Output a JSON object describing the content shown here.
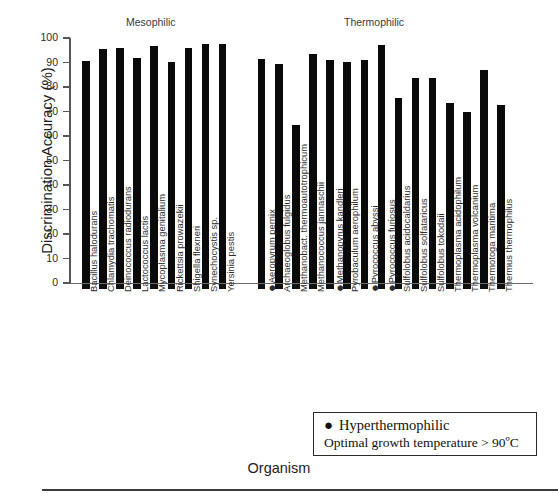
{
  "chart_data": {
    "type": "bar",
    "title": "",
    "xlabel": "Organism",
    "ylabel": "Discrimination Accuracy (%)",
    "ylim": [
      0,
      100
    ],
    "ytick_labels": [
      "0",
      "10",
      "20",
      "30",
      "40",
      "50",
      "60",
      "70",
      "80",
      "90",
      "100"
    ],
    "yticks": [
      0,
      10,
      20,
      30,
      40,
      50,
      60,
      70,
      80,
      90,
      100
    ],
    "grid": false,
    "legend_position": "bottom-right",
    "group_headers": [
      {
        "label": "Mesophilic",
        "start_index": 0,
        "end_index": 8
      },
      {
        "label": "Thermophilic",
        "start_index": 9,
        "end_index": 23
      }
    ],
    "categories": [
      "Bacillus halodurans",
      "Chlamydia trachomatis",
      "Deinococcus radiodurans",
      "Lactococcus lactis",
      "Mycoplasma genitalium",
      "Rickettsia prowazekii",
      "Shigella flexneri",
      "Synechocystis sp.",
      "Yersinia pestis",
      "Aeropyrum pernix",
      "Archaeoglobus fulgidus",
      "Methanobact. thermoautotrophicum",
      "Methanococcus jannaschii",
      "Methanopyrus kandleri",
      "Pyrobaculum aerophilum",
      "Pyrococcus abyssi",
      "Pyrococcus furiosus",
      "Sulfolobus acidocaldarius",
      "Sulfolobus solfataricus",
      "Sulfolobus tokodaii",
      "Thermoplasma acidophilum",
      "Thermoplasma volcanium",
      "Thermotoga maritima",
      "Thermus thermophilus"
    ],
    "values": [
      90.7,
      95.6,
      96.0,
      91.7,
      96.8,
      90.1,
      96.1,
      97.7,
      97.6,
      91.5,
      89.3,
      64.5,
      93.3,
      91.0,
      90.3,
      91.0,
      97.0,
      75.5,
      83.5,
      83.5,
      73.5,
      70.0,
      86.8,
      72.7
    ],
    "hyperthermophilic_flags": [
      false,
      false,
      false,
      false,
      false,
      false,
      false,
      false,
      false,
      true,
      false,
      false,
      false,
      true,
      false,
      true,
      true,
      false,
      false,
      false,
      false,
      false,
      false,
      false
    ],
    "group_of": [
      "Mesophilic",
      "Mesophilic",
      "Mesophilic",
      "Mesophilic",
      "Mesophilic",
      "Mesophilic",
      "Mesophilic",
      "Mesophilic",
      "Mesophilic",
      "Thermophilic",
      "Thermophilic",
      "Thermophilic",
      "Thermophilic",
      "Thermophilic",
      "Thermophilic",
      "Thermophilic",
      "Thermophilic",
      "Thermophilic",
      "Thermophilic",
      "Thermophilic",
      "Thermophilic",
      "Thermophilic",
      "Thermophilic",
      "Thermophilic"
    ],
    "bar_color": "#0a0a0a",
    "axis_color": "#575757"
  },
  "legend": {
    "marker": "●",
    "line1": "Hyperthermophilic",
    "line2": "Optimal growth temperature > 90ºC"
  },
  "axis": {
    "ylabel": "Discrimination Accuracy (%)",
    "xlabel": "Organism"
  },
  "headers": {
    "mesophilic": "Mesophilic",
    "thermophilic": "Thermophilic"
  }
}
